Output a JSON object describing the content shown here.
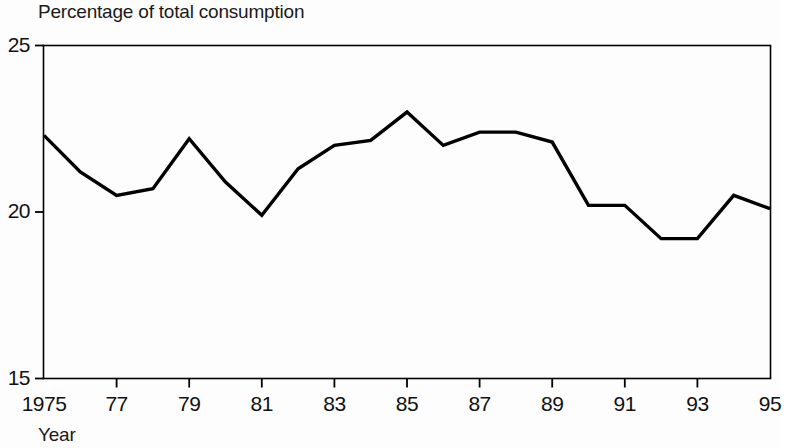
{
  "chart_data": {
    "type": "line",
    "title": "Percentage of total consumption",
    "xlabel": "Year",
    "ylabel": "",
    "xlim": [
      1975,
      1995
    ],
    "ylim": [
      15,
      25
    ],
    "grid": false,
    "legend": "none",
    "y_ticks": [
      "25",
      "20",
      "15"
    ],
    "y_tick_values": [
      25,
      20,
      15
    ],
    "x_ticks": [
      "1975",
      "77",
      "79",
      "81",
      "83",
      "85",
      "87",
      "89",
      "91",
      "93",
      "95"
    ],
    "x_tick_values": [
      1975,
      1977,
      1979,
      1981,
      1983,
      1985,
      1987,
      1989,
      1991,
      1993,
      1995
    ],
    "x": [
      1975,
      1976,
      1977,
      1978,
      1979,
      1980,
      1981,
      1982,
      1983,
      1984,
      1985,
      1986,
      1987,
      1988,
      1989,
      1990,
      1991,
      1992,
      1993,
      1994,
      1995
    ],
    "values": [
      22.3,
      21.2,
      20.5,
      20.7,
      22.2,
      20.9,
      19.9,
      21.3,
      22.0,
      22.15,
      23.0,
      22.0,
      22.4,
      22.4,
      22.1,
      20.2,
      20.2,
      19.2,
      19.2,
      20.5,
      20.1
    ],
    "series": [
      {
        "name": "Percentage of total consumption",
        "color": "#000000",
        "values": [
          22.3,
          21.2,
          20.5,
          20.7,
          22.2,
          20.9,
          19.9,
          21.3,
          22.0,
          22.15,
          23.0,
          22.0,
          22.4,
          22.4,
          22.1,
          20.2,
          20.2,
          19.2,
          19.2,
          20.5,
          20.1
        ]
      }
    ]
  },
  "axes": {
    "title": "Percentage of total consumption",
    "x_axis_name": "Year",
    "y_tick_labels": [
      "25",
      "20",
      "15"
    ],
    "x_tick_labels": [
      "1975",
      "77",
      "79",
      "81",
      "83",
      "85",
      "87",
      "89",
      "91",
      "93",
      "95"
    ]
  },
  "colors": {
    "line": "#000000",
    "axis": "#000000",
    "text": "#111111",
    "background": "#fdfdfd"
  }
}
